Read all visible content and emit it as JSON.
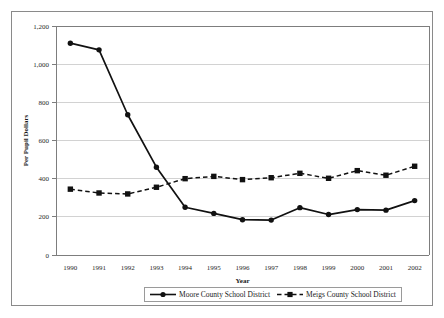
{
  "chart_data": {
    "type": "line",
    "title": "",
    "xlabel": "Year",
    "ylabel": "Per Pupil Dollars",
    "categories": [
      "1990",
      "1991",
      "1992",
      "1993",
      "1994",
      "1995",
      "1996",
      "1997",
      "1998",
      "1999",
      "2000",
      "2001",
      "2002"
    ],
    "ylim": [
      0,
      1200
    ],
    "ytick_labels": [
      "1,200",
      "1,000",
      "800",
      "600",
      "400",
      "200",
      "0"
    ],
    "ytick_values": [
      1200,
      1000,
      800,
      600,
      400,
      200,
      0
    ],
    "grid": true,
    "legend_position": "bottom",
    "series": [
      {
        "name": "Moore County School District",
        "marker": "circle",
        "line_style": "solid",
        "color": "#111111",
        "values": [
          1110,
          1075,
          735,
          460,
          250,
          218,
          185,
          183,
          248,
          212,
          238,
          235,
          285
        ]
      },
      {
        "name": "Meigs County School District",
        "marker": "square",
        "line_style": "dashed",
        "color": "#111111",
        "values": [
          345,
          325,
          320,
          355,
          400,
          412,
          395,
          405,
          428,
          402,
          442,
          418,
          465
        ]
      }
    ]
  }
}
